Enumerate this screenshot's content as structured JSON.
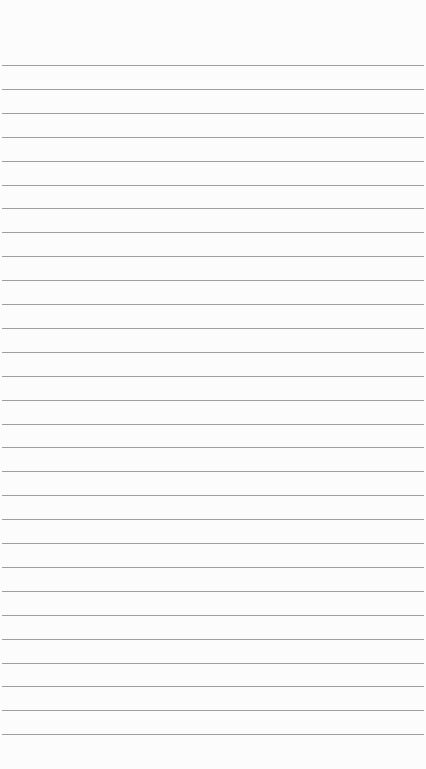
{
  "paper": {
    "type": "lined-paper",
    "line_color": "#8d8d8d",
    "background": "#fcfcfc",
    "line_count": 29,
    "first_line_y": 65,
    "line_spacing": 23.9
  }
}
